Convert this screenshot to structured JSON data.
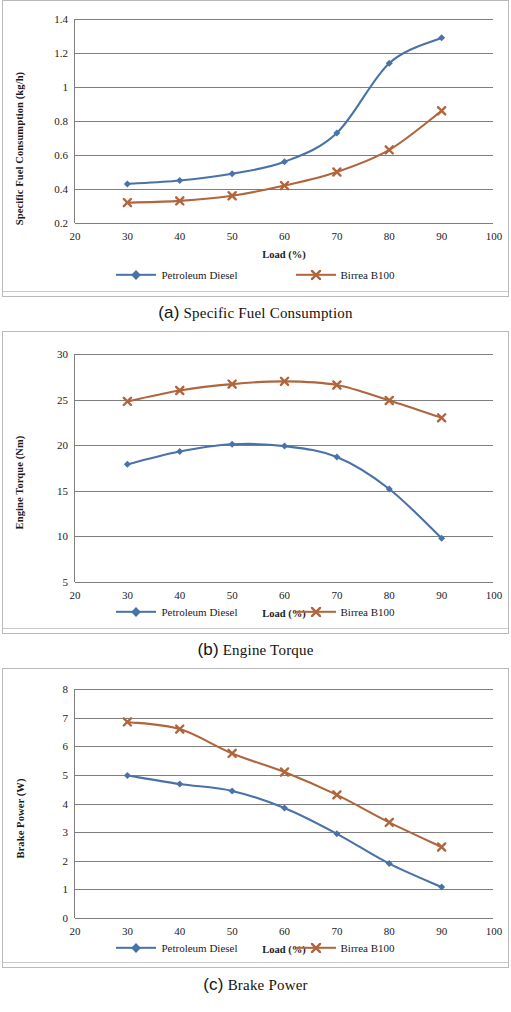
{
  "colors": {
    "series_diesel": "#4a72a8",
    "series_b100": "#b0653c",
    "grid": "#7e7e7e",
    "axis": "#808080",
    "panel_border": "#b9b9b9",
    "text": "#1a1a1a"
  },
  "legend": {
    "diesel_label": "Petroleum Diesel",
    "b100_label": "Birrea B100"
  },
  "captions": {
    "a_tag": "(a)",
    "a_text": "Specific Fuel Consumption",
    "b_tag": "(b)",
    "b_text": "Engine Torque",
    "c_tag": "(c)",
    "c_text": "Brake Power"
  },
  "chart_data": [
    {
      "id": "a",
      "type": "line",
      "title": "",
      "xlabel": "Load (%)",
      "ylabel": "Specific Fuel Consumption (kg/h)",
      "x": [
        30,
        40,
        50,
        60,
        70,
        80,
        90
      ],
      "xlim": [
        20,
        100
      ],
      "xticks": [
        20,
        30,
        40,
        50,
        60,
        70,
        80,
        90,
        100
      ],
      "xtick_labels": [
        "20",
        "30",
        "40",
        "50",
        "60",
        "70",
        "80",
        "90",
        "100"
      ],
      "ylim": [
        0.2,
        1.4
      ],
      "yticks": [
        0.2,
        0.4,
        0.6,
        0.8,
        1.0,
        1.2,
        1.4
      ],
      "ytick_labels": [
        "0.2",
        "0.4",
        "0.6",
        "0.8",
        "1",
        "1.2",
        "1.4"
      ],
      "grid": true,
      "legend_position": "bottom",
      "series": [
        {
          "name": "Petroleum Diesel",
          "color": "#4a72a8",
          "marker": "diamond",
          "values": [
            0.43,
            0.45,
            0.49,
            0.56,
            0.73,
            1.14,
            1.29
          ]
        },
        {
          "name": "Birrea B100",
          "color": "#b0653c",
          "marker": "cross",
          "values": [
            0.32,
            0.33,
            0.36,
            0.42,
            0.5,
            0.63,
            0.86
          ]
        }
      ]
    },
    {
      "id": "b",
      "type": "line",
      "title": "",
      "xlabel": "Load (%)",
      "ylabel": "Engine Torque (Nm)",
      "x": [
        30,
        40,
        50,
        60,
        70,
        80,
        90
      ],
      "xlim": [
        20,
        100
      ],
      "xticks": [
        20,
        30,
        40,
        50,
        60,
        70,
        80,
        90,
        100
      ],
      "xtick_labels": [
        "20",
        "30",
        "40",
        "50",
        "60",
        "70",
        "80",
        "90",
        "100"
      ],
      "ylim": [
        5,
        30
      ],
      "yticks": [
        5,
        10,
        15,
        20,
        25,
        30
      ],
      "ytick_labels": [
        "5",
        "10",
        "15",
        "20",
        "25",
        "30"
      ],
      "grid": true,
      "legend_position": "bottom",
      "series": [
        {
          "name": "Petroleum Diesel",
          "color": "#4a72a8",
          "marker": "diamond",
          "values": [
            17.9,
            19.3,
            20.1,
            19.9,
            18.7,
            15.2,
            9.8
          ]
        },
        {
          "name": "Birrea B100",
          "color": "#b0653c",
          "marker": "cross",
          "values": [
            24.8,
            26.0,
            26.7,
            27.0,
            26.6,
            24.9,
            23.0
          ]
        }
      ]
    },
    {
      "id": "c",
      "type": "line",
      "title": "",
      "xlabel": "Load (%)",
      "ylabel": "Brake Power (W)",
      "x": [
        30,
        40,
        50,
        60,
        70,
        80,
        90
      ],
      "xlim": [
        20,
        100
      ],
      "xticks": [
        20,
        30,
        40,
        50,
        60,
        70,
        80,
        90,
        100
      ],
      "xtick_labels": [
        "20",
        "30",
        "40",
        "50",
        "60",
        "70",
        "80",
        "90",
        "100"
      ],
      "ylim": [
        0,
        8
      ],
      "yticks": [
        0,
        1,
        2,
        3,
        4,
        5,
        6,
        7,
        8
      ],
      "ytick_labels": [
        "0",
        "1",
        "2",
        "3",
        "4",
        "5",
        "6",
        "7",
        "8"
      ],
      "grid": true,
      "legend_position": "bottom",
      "series": [
        {
          "name": "Petroleum Diesel",
          "color": "#4a72a8",
          "marker": "diamond",
          "values": [
            4.98,
            4.68,
            4.44,
            3.84,
            2.94,
            1.9,
            1.08
          ]
        },
        {
          "name": "Birrea B100",
          "color": "#b0653c",
          "marker": "cross",
          "values": [
            6.85,
            6.6,
            5.75,
            5.1,
            4.3,
            3.34,
            2.48
          ]
        }
      ]
    }
  ]
}
